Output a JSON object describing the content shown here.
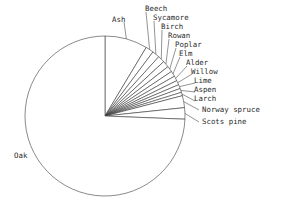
{
  "chart_data": {
    "type": "pie",
    "title": "",
    "subtitle": "",
    "xlabel": "",
    "ylabel": "",
    "grid": false,
    "legend_position": "none",
    "label_style": "leader-lines-outside",
    "start_angle_deg": 90,
    "direction": "clockwise",
    "center": {
      "x": 105,
      "y": 116
    },
    "radius": 80,
    "categories": [
      "Ash",
      "Beech",
      "Sycamore",
      "Birch",
      "Rowan",
      "Poplar",
      "Elm",
      "Alder",
      "Willow",
      "Lime",
      "Aspen",
      "Larch",
      "Norway spruce",
      "Scots pine",
      "Oak"
    ],
    "values": [
      8.6,
      1.6,
      1.5,
      1.4,
      1.3,
      1.2,
      1.1,
      1.0,
      0.9,
      0.8,
      0.8,
      0.7,
      2.4,
      2.3,
      74.4
    ],
    "units": "percent",
    "slices": [
      {
        "label": "Ash",
        "value": 8.6,
        "start_deg": 0.0,
        "end_deg": 31.0
      },
      {
        "label": "Beech",
        "value": 1.6,
        "start_deg": 31.0,
        "end_deg": 36.8
      },
      {
        "label": "Sycamore",
        "value": 1.5,
        "start_deg": 36.8,
        "end_deg": 42.2
      },
      {
        "label": "Birch",
        "value": 1.4,
        "start_deg": 42.2,
        "end_deg": 47.2
      },
      {
        "label": "Rowan",
        "value": 1.3,
        "start_deg": 47.2,
        "end_deg": 51.9
      },
      {
        "label": "Poplar",
        "value": 1.2,
        "start_deg": 51.9,
        "end_deg": 56.2
      },
      {
        "label": "Elm",
        "value": 1.1,
        "start_deg": 56.2,
        "end_deg": 60.2
      },
      {
        "label": "Alder",
        "value": 1.0,
        "start_deg": 60.2,
        "end_deg": 63.8
      },
      {
        "label": "Willow",
        "value": 0.9,
        "start_deg": 63.8,
        "end_deg": 67.0
      },
      {
        "label": "Lime",
        "value": 0.8,
        "start_deg": 67.0,
        "end_deg": 69.9
      },
      {
        "label": "Aspen",
        "value": 0.8,
        "start_deg": 69.9,
        "end_deg": 72.8
      },
      {
        "label": "Larch",
        "value": 0.7,
        "start_deg": 72.8,
        "end_deg": 75.3
      },
      {
        "label": "Norway spruce",
        "value": 2.4,
        "start_deg": 75.3,
        "end_deg": 84.0
      },
      {
        "label": "Scots pine",
        "value": 2.3,
        "start_deg": 84.0,
        "end_deg": 92.3
      },
      {
        "label": "Oak",
        "value": 74.4,
        "start_deg": 92.3,
        "end_deg": 360.0
      }
    ]
  },
  "labels": {
    "ash": "Ash",
    "beech": "Beech",
    "sycamore": "Sycamore",
    "birch": "Birch",
    "rowan": "Rowan",
    "poplar": "Poplar",
    "elm": "Elm",
    "alder": "Alder",
    "willow": "Willow",
    "lime": "Lime",
    "aspen": "Aspen",
    "larch": "Larch",
    "norway_spruce": "Norway spruce",
    "scots_pine": "Scots pine",
    "oak": "Oak"
  },
  "colors": {
    "background": "#ffffff",
    "stroke": "#3a3a3a",
    "text": "#2b2b2b"
  }
}
